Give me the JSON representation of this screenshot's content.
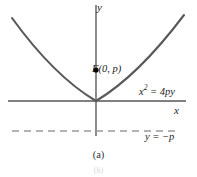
{
  "figure": {
    "caption": "(a)",
    "partial_glyph": "(b)",
    "background_color": "#ffffff"
  },
  "axes": {
    "x_label": "x",
    "y_label": "y",
    "axis_color": "#808080",
    "x_axis": {
      "x_start": 8,
      "x_end": 186,
      "y": 101
    },
    "y_axis": {
      "x": 96,
      "y_start": 5,
      "y_end": 136
    }
  },
  "curve": {
    "name": "parabola",
    "equation_label": "x",
    "equation_exponent": "2",
    "equation_rest": " = 4py",
    "color": "#595959",
    "stroke_width": 2.1,
    "vertex": {
      "x": 96,
      "y": 101
    },
    "x_range": [
      12,
      184
    ],
    "points": [
      [
        12,
        18
      ],
      [
        24,
        38
      ],
      [
        36,
        55
      ],
      [
        48,
        70
      ],
      [
        60,
        82
      ],
      [
        72,
        91
      ],
      [
        84,
        98
      ],
      [
        96,
        101
      ],
      [
        108,
        98
      ],
      [
        120,
        91
      ],
      [
        132,
        82
      ],
      [
        144,
        70
      ],
      [
        156,
        55
      ],
      [
        168,
        38
      ],
      [
        180,
        20
      ],
      [
        184,
        15
      ]
    ]
  },
  "focus": {
    "label": "F(0, p)",
    "marker_color": "#000000",
    "position": {
      "x": 96,
      "y": 70
    },
    "marker_radius": 2.6
  },
  "directrix": {
    "label": "y = −p",
    "color": "#9a9a9a",
    "y": 131,
    "x_start": 12,
    "x_end": 176,
    "dash_pattern": "7 5"
  }
}
